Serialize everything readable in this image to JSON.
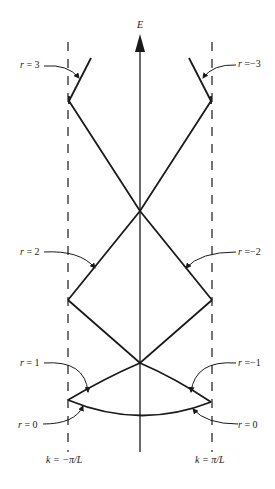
{
  "diagram": {
    "type": "reduced-zone band structure (E vs k)",
    "axis": {
      "vertical_label": "E"
    },
    "boundaries": {
      "left": "k = −π/L",
      "right": "k = π/L"
    },
    "bands": [
      {
        "id": "r0",
        "left_label": "r = 0",
        "right_label": "r = 0"
      },
      {
        "id": "r1",
        "left_label": "r = 1",
        "right_label": "r =−1"
      },
      {
        "id": "r2",
        "left_label": "r = 2",
        "right_label": "r =−2"
      },
      {
        "id": "r3",
        "left_label": "r = 3",
        "right_label": "r =−3"
      }
    ]
  },
  "labels": {
    "E": "E",
    "k_left": "k = −π/L",
    "k_right": "k = π/L",
    "r3_left": "r = 3",
    "r3_right": "r =−3",
    "r2_left": "r = 2",
    "r2_right": "r =−2",
    "r1_left": "r = 1",
    "r1_right": "r =−1",
    "r0_left": "r = 0",
    "r0_right": "r = 0"
  },
  "colors": {
    "ink": "#1a1a1a",
    "background": "#ffffff"
  }
}
